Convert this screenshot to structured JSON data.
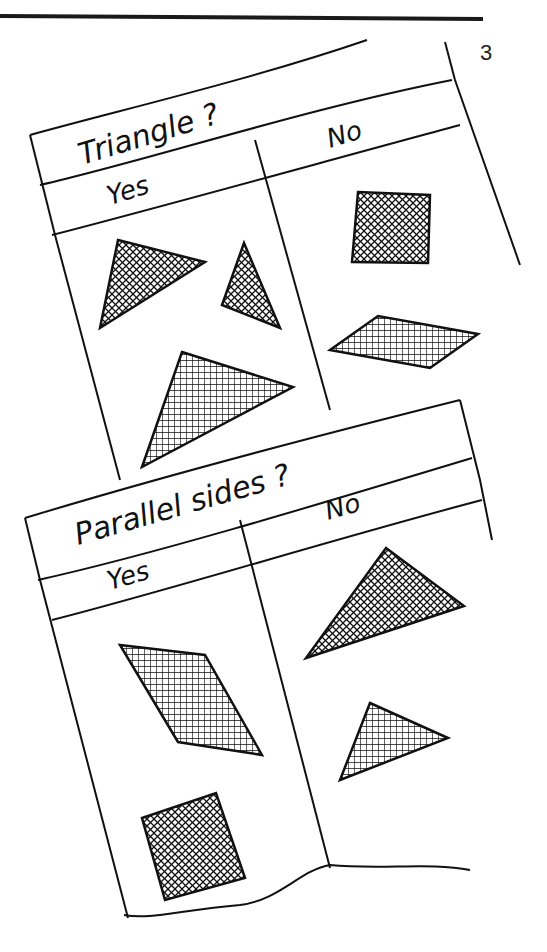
{
  "page": {
    "number": "3",
    "rule_color": "#1a1a1a",
    "ink_color": "#111111",
    "background": "#ffffff"
  },
  "sorting_tables": [
    {
      "question": "Triangle ?",
      "columns": [
        {
          "label": "Yes",
          "shapes": [
            "triangle",
            "triangle",
            "triangle"
          ]
        },
        {
          "label": "No",
          "shapes": [
            "square",
            "rhombus"
          ]
        }
      ]
    },
    {
      "question": "Parallel sides ?",
      "columns": [
        {
          "label": "Yes",
          "shapes": [
            "parallelogram",
            "square"
          ]
        },
        {
          "label": "No",
          "shapes": [
            "triangle",
            "triangle"
          ]
        }
      ]
    }
  ]
}
